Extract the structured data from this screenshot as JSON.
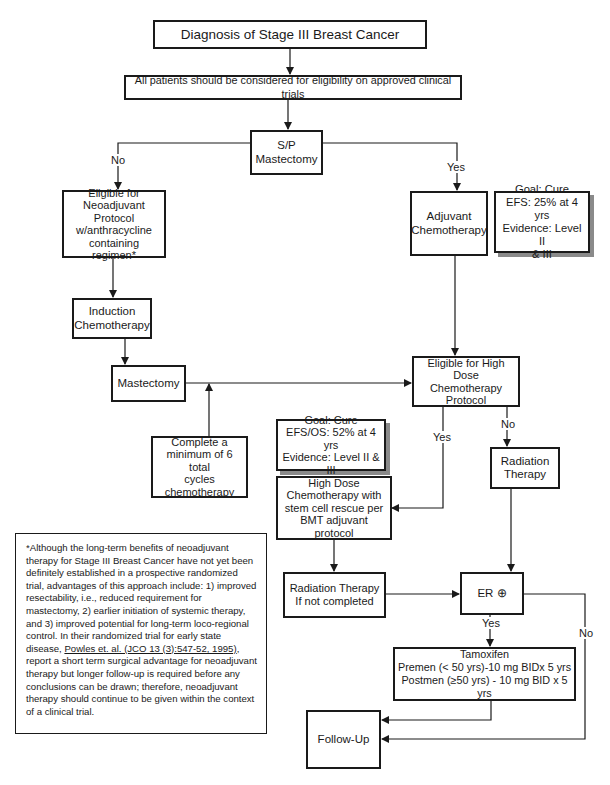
{
  "title": "Diagnosis of Stage III Breast Cancer",
  "nodes": {
    "diagnosis": {
      "lines": [
        "Diagnosis of Stage III Breast Cancer"
      ]
    },
    "clinical_trials": {
      "lines": [
        "All patients should be considered for eligibility on approved clinical trials"
      ]
    },
    "sp_mastectomy": {
      "lines": [
        "S/P",
        "Mastectomy"
      ]
    },
    "neoadjuvant": {
      "lines": [
        "Eligible for",
        "Neoadjuvant",
        "Protocol",
        "w/anthracycline",
        "containing regimen*"
      ]
    },
    "adjuvant": {
      "lines": [
        "Adjuvant",
        "Chemotherapy"
      ]
    },
    "goal_adjuvant": {
      "lines": [
        "Goal: Cure",
        "EFS: 25% at 4 yrs",
        "Evidence: Level II",
        "& III"
      ]
    },
    "induction": {
      "lines": [
        "Induction",
        "Chemotherapy"
      ]
    },
    "mastectomy": {
      "lines": [
        "Mastectomy"
      ]
    },
    "complete_cycles": {
      "lines": [
        "Complete a",
        "minimum of 6 total",
        "cycles",
        "chemotherapy"
      ]
    },
    "eligible_high_dose": {
      "lines": [
        "Eligible for High Dose",
        "Chemotherapy",
        "Protocol"
      ]
    },
    "goal_high_dose": {
      "lines": [
        "Goal: Cure",
        "EFS/OS: 52% at 4 yrs",
        "Evidence: Level II & III"
      ]
    },
    "high_dose_chemo": {
      "lines": [
        "High Dose",
        "Chemotherapy with",
        "stem cell rescue per",
        "BMT adjuvant protocol"
      ]
    },
    "radiation_therapy": {
      "lines": [
        "Radiation",
        "Therapy"
      ]
    },
    "radiation_if_not": {
      "lines": [
        "Radiation Therapy",
        "If not completed"
      ]
    },
    "er_positive": {
      "lines": [
        "ER ⊕"
      ]
    },
    "tamoxifen": {
      "lines": [
        "Tamoxifen",
        "Premen (< 50 yrs)-10 mg BIDx 5 yrs",
        "Postmen (≥50 yrs) - 10 mg BID x 5 yrs"
      ]
    },
    "follow_up": {
      "lines": [
        "Follow-Up"
      ]
    }
  },
  "edge_labels": {
    "sp_no": "No",
    "sp_yes": "Yes",
    "hd_yes": "Yes",
    "hd_no": "No",
    "er_yes": "Yes",
    "er_no": "No"
  },
  "footnote": {
    "text_before": "*Although the long-term benefits of neoadjuvant therapy for Stage III Breast Cancer have not yet been definitely established in a prospective randomized trial, advantages of this approach include: 1) improved resectability, i.e., reduced requirement for mastectomy, 2) earlier initiation of systemic therapy, and 3) improved potential for long-term loco-regional control. In their randomized trial for early state disease, ",
    "citation": "Powles et. al. (JCO 13 (3):547-52, 1995)",
    "text_after": ", report a short term surgical advantage for neoadjuvant therapy but longer follow-up is required before any conclusions can be drawn; therefore, neoadjuvant therapy should continue to be given within the context of a clinical trial."
  }
}
